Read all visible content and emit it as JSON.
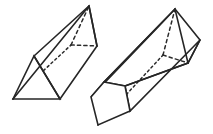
{
  "figure": {
    "background_color": "#ffffff",
    "stroke_color": "#262626",
    "hidden_stroke_color": "#2b2b2b",
    "width": 213,
    "height": 134,
    "shapes": [
      {
        "name": "triangular-prism",
        "label": "Triangular prism",
        "position": "left",
        "cross_section": "triangle",
        "near_face_points": "13,99 34,56 60,99",
        "far_face_points": "89,6 68,49 97,46",
        "hidden_vertex": "71,45",
        "visible_long_edges": [
          "13,99 89,6",
          "34,56 89,6",
          "60,99 97,46"
        ],
        "hidden_long_edges": [
          "13,99 71,45"
        ],
        "hidden_face_edges": [
          "71,45 89,6",
          "71,45 97,46"
        ]
      },
      {
        "name": "pentagonal-prism",
        "label": "Pentagonal prism",
        "position": "right",
        "cross_section": "pentagon",
        "near_face_points": "91,97 104,82 125,86 130,111 98,125",
        "far_face_points": "175,9 159,26 186,33 200,40 188,63",
        "hidden_vertex": "163,55",
        "visible_long_edges": [
          "91,97 159,26",
          "104,82 175,9",
          "125,86 188,63",
          "130,111 200,40"
        ],
        "hidden_long_edges": [
          "98,125 163,55"
        ],
        "hidden_face_edges": [
          "163,55 175,9",
          "163,55 188,63"
        ],
        "ridge_strip": "91,97 104,82 175,9 159,26"
      }
    ]
  }
}
